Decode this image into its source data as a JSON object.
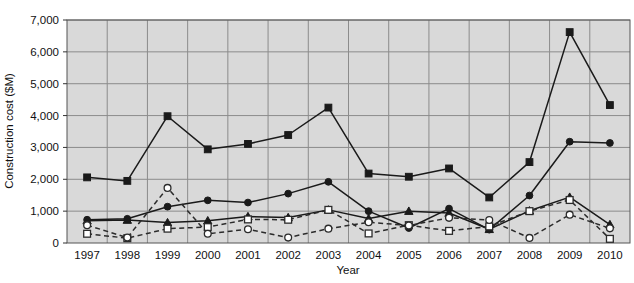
{
  "chart_data": {
    "type": "line",
    "title": "",
    "xlabel": "Year",
    "ylabel": "Construction cost ($M)",
    "categories": [
      1997,
      1998,
      1999,
      2000,
      2001,
      2002,
      2003,
      2004,
      2005,
      2006,
      2007,
      2008,
      2009,
      2010
    ],
    "x_tick_labels": [
      "1997",
      "1998",
      "1999",
      "2000",
      "2001",
      "2002",
      "2003",
      "2004",
      "2005",
      "2006",
      "2007",
      "2008",
      "2009",
      "2010"
    ],
    "y_tick_labels": [
      "0",
      "1,000",
      "2,000",
      "3,000",
      "4,000",
      "5,000",
      "6,000",
      "7,000"
    ],
    "y_ticks": [
      0,
      1000,
      2000,
      3000,
      4000,
      5000,
      6000,
      7000
    ],
    "ylim": [
      0,
      7000
    ],
    "grid": true,
    "legend": "none",
    "plot_bg": "#d9d9d9",
    "series": [
      {
        "name": "series-filled-square",
        "marker": "filled-square",
        "line_style": "solid",
        "color": "#1a1a1a",
        "values": [
          2060,
          1950,
          3980,
          2940,
          3110,
          3390,
          4250,
          2180,
          2080,
          2340,
          1430,
          2540,
          6620,
          4330
        ]
      },
      {
        "name": "series-filled-circle",
        "marker": "filled-circle",
        "line_style": "solid",
        "color": "#1a1a1a",
        "values": [
          730,
          760,
          1140,
          1340,
          1270,
          1550,
          1920,
          1000,
          470,
          1080,
          420,
          1490,
          3180,
          3140
        ]
      },
      {
        "name": "series-filled-triangle",
        "marker": "filled-triangle",
        "line_style": "solid",
        "color": "#1a1a1a",
        "values": [
          700,
          720,
          640,
          700,
          830,
          800,
          1040,
          770,
          1000,
          940,
          430,
          1010,
          1440,
          580
        ]
      },
      {
        "name": "series-open-square",
        "marker": "open-square",
        "line_style": "dashed",
        "color": "#2b2b2b",
        "values": [
          290,
          150,
          450,
          500,
          740,
          730,
          1040,
          300,
          560,
          380,
          520,
          1000,
          1350,
          130
        ]
      },
      {
        "name": "series-open-circle",
        "marker": "open-circle",
        "line_style": "dashed",
        "color": "#2b2b2b",
        "values": [
          560,
          170,
          1730,
          290,
          430,
          170,
          450,
          650,
          550,
          790,
          720,
          160,
          890,
          460
        ]
      }
    ]
  },
  "axes": {
    "x_title": "Year",
    "y_title": "Construction cost ($M)"
  }
}
